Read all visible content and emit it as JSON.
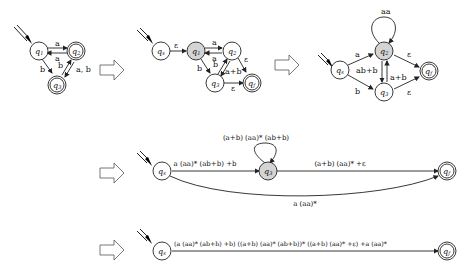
{
  "stage1": {
    "states": [
      "q1",
      "q2",
      "q3"
    ],
    "accepting": [
      "q2",
      "q3"
    ],
    "start": "q1",
    "edges": [
      {
        "from": "q1",
        "to": "q2",
        "label": "a"
      },
      {
        "from": "q2",
        "to": "q1",
        "label": "a"
      },
      {
        "from": "q1",
        "to": "q3",
        "label": "b"
      },
      {
        "from": "q3",
        "to": "q2",
        "label": "b"
      },
      {
        "from": "q2",
        "to": "q3",
        "label": "a, b"
      }
    ]
  },
  "stage2": {
    "states": [
      "qs",
      "q1",
      "q2",
      "q3",
      "qf"
    ],
    "highlighted": "q1",
    "edges": [
      {
        "from": "qs",
        "to": "q1",
        "label": "ε"
      },
      {
        "from": "q1",
        "to": "q2",
        "label": "a"
      },
      {
        "from": "q2",
        "to": "q1",
        "label": "a"
      },
      {
        "from": "q1",
        "to": "q3",
        "label": "b"
      },
      {
        "from": "q3",
        "to": "q2",
        "label": "b"
      },
      {
        "from": "q2",
        "to": "q3",
        "label": "a+b"
      },
      {
        "from": "q2",
        "to": "qf",
        "label": "ε"
      },
      {
        "from": "q3",
        "to": "qf",
        "label": "ε"
      }
    ]
  },
  "stage3": {
    "states": [
      "qs",
      "q2",
      "q3",
      "qf"
    ],
    "highlighted": "q2",
    "edges": [
      {
        "from": "q2",
        "to": "q2",
        "label": "aa"
      },
      {
        "from": "qs",
        "to": "q2",
        "label": "a"
      },
      {
        "from": "qs",
        "to": "q3",
        "label": "b"
      },
      {
        "from": "q2",
        "to": "q3",
        "label": "ab+b"
      },
      {
        "from": "q3",
        "to": "q2",
        "label": "a+b"
      },
      {
        "from": "q2",
        "to": "qf",
        "label": "ε"
      },
      {
        "from": "q3",
        "to": "qf",
        "label": "ε"
      }
    ]
  },
  "stage4": {
    "states": [
      "qs",
      "q3",
      "qf"
    ],
    "highlighted": "q3",
    "edges": [
      {
        "from": "q3",
        "to": "q3",
        "label": "(a+b) (aa)* (ab+b)"
      },
      {
        "from": "qs",
        "to": "q3",
        "label": "a (aa)* (ab+b) +b"
      },
      {
        "from": "q3",
        "to": "qf",
        "label": "(a+b) (aa)* +ε"
      },
      {
        "from": "qs",
        "to": "qf",
        "label": "a (aa)*"
      }
    ]
  },
  "stage5": {
    "states": [
      "qs",
      "qf"
    ],
    "edges": [
      {
        "from": "qs",
        "to": "qf",
        "label": "(a (aa)* (ab+b) +b) ((a+b) (aa)* (ab+b))* ((a+b) (aa)* +ε) +a (aa)*"
      }
    ]
  },
  "labels": {
    "q1": "q1",
    "q2": "q2",
    "q3": "q3",
    "qs": "qs",
    "qf": "qf"
  }
}
